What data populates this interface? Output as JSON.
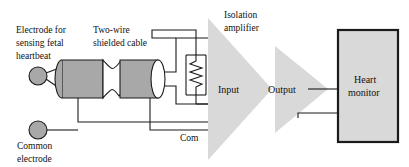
{
  "diagram": {
    "canvas": {
      "width": 409,
      "height": 167
    },
    "labels": {
      "electrode_sensing": {
        "line1": "Electrode for",
        "line2": "sensing fetal",
        "line3": "heartbeat"
      },
      "cable": {
        "line1": "Two-wire",
        "line2": "shielded cable"
      },
      "common_electrode": {
        "line1": "Common",
        "line2": "electrode"
      },
      "isolation_amplifier": {
        "line1": "Isolation",
        "line2": "amplifier"
      },
      "input": "Input",
      "output": "Output",
      "common_terminal": "Com",
      "heart_monitor": {
        "line1": "Heart",
        "line2": "monitor"
      }
    },
    "colors": {
      "line": "#1a1a1a",
      "cable_fill": "#a8a8a8",
      "electrode_fill": "#a8a8a8",
      "amplifier_fill": "#d9d9d9",
      "monitor_fill": "#d9d9d9",
      "background": "#ffffff",
      "text": "#111111"
    },
    "components": [
      {
        "name": "fetal-sensing-electrode",
        "type": "electrode",
        "shape": "circle"
      },
      {
        "name": "common-electrode",
        "type": "electrode",
        "shape": "circle"
      },
      {
        "name": "two-wire-shielded-cable",
        "type": "cable",
        "shape": "two-cylinders-twisted-pair"
      },
      {
        "name": "input-resistor",
        "type": "resistor",
        "shape": "zigzag"
      },
      {
        "name": "input-amplifier-stage",
        "type": "amplifier",
        "shape": "triangle"
      },
      {
        "name": "output-amplifier-stage",
        "type": "amplifier",
        "shape": "triangle"
      },
      {
        "name": "heart-monitor",
        "type": "instrument",
        "shape": "rectangle"
      }
    ]
  }
}
